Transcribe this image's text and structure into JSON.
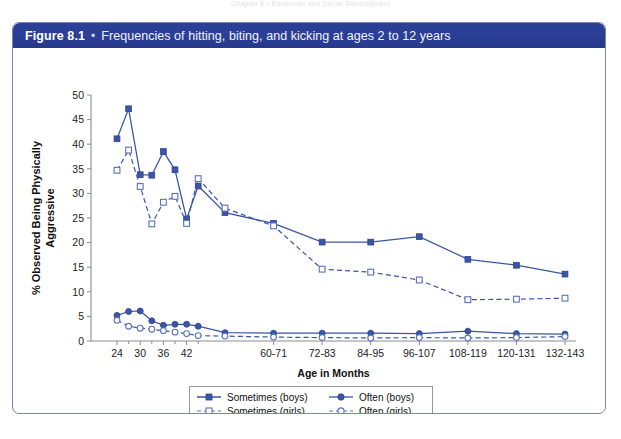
{
  "page": {
    "running_head": "Chapter 8    •    Emotional and Social Development"
  },
  "figure": {
    "number": "Figure 8.1",
    "bullet": "•",
    "title": "Frequencies of hitting, biting, and kicking at ages 2 to 12 years"
  },
  "legend": {
    "position": "bottom-center",
    "entries": [
      {
        "label": "Sometimes (boys)",
        "marker": "filled-square",
        "line": "solid",
        "color": "#3a55a5"
      },
      {
        "label": "Often (boys)",
        "marker": "filled-circle",
        "line": "solid",
        "color": "#3a55a5"
      },
      {
        "label": "Sometimes (girls)",
        "marker": "open-square",
        "line": "dashed",
        "color": "#5a72bd"
      },
      {
        "label": "Often (girls)",
        "marker": "open-circle",
        "line": "dashed",
        "color": "#5a72bd"
      }
    ]
  },
  "chart_data": {
    "type": "line",
    "title": "Frequencies of hitting, biting, and kicking at ages 2 to 12 years",
    "xlabel": "Age in Months",
    "ylabel": "% Observed Being Physically Aggressive",
    "ylim": [
      0,
      50
    ],
    "ytick_labels": [
      "0",
      "5",
      "10",
      "15",
      "20",
      "25",
      "30",
      "35",
      "40",
      "45",
      "50"
    ],
    "yticks": [
      0,
      5,
      10,
      15,
      20,
      25,
      30,
      35,
      40,
      45,
      50
    ],
    "grid": false,
    "x_tick_labels": [
      "24",
      "30",
      "36",
      "42",
      "60-71",
      "72-83",
      "84-95",
      "96-107",
      "108-119",
      "120-131",
      "132-143"
    ],
    "x_categories": [
      "24",
      "27",
      "30",
      "33",
      "36",
      "39",
      "42",
      "45",
      "48-59",
      "60-71",
      "72-83",
      "84-95",
      "96-107",
      "108-119",
      "120-131",
      "132-143"
    ],
    "series": [
      {
        "name": "Sometimes (boys)",
        "marker": "filled-square",
        "line": "solid",
        "color": "#3a55a5",
        "values": [
          41.1,
          47.2,
          33.8,
          33.7,
          38.5,
          34.8,
          24.8,
          31.5,
          26.1,
          23.9,
          20.1,
          20.1,
          21.2,
          16.6,
          15.4,
          13.6
        ]
      },
      {
        "name": "Sometimes (girls)",
        "marker": "open-square",
        "line": "dashed",
        "color": "#5a72bd",
        "values": [
          34.7,
          38.8,
          31.4,
          23.8,
          28.2,
          29.4,
          23.9,
          33.0,
          27.0,
          23.4,
          14.6,
          14.0,
          12.4,
          8.4,
          8.5,
          8.7
        ]
      },
      {
        "name": "Often (boys)",
        "marker": "filled-circle",
        "line": "solid",
        "color": "#3a55a5",
        "values": [
          5.2,
          6.0,
          6.1,
          4.1,
          3.2,
          3.4,
          3.4,
          3.0,
          1.7,
          1.6,
          1.6,
          1.6,
          1.5,
          2.0,
          1.5,
          1.4
        ]
      },
      {
        "name": "Often (girls)",
        "marker": "open-circle",
        "line": "dashed",
        "color": "#5a72bd",
        "values": [
          4.2,
          3.0,
          2.6,
          2.4,
          2.1,
          1.8,
          1.5,
          1.1,
          1.0,
          0.8,
          0.7,
          0.6,
          0.7,
          0.6,
          0.7,
          0.9
        ]
      }
    ]
  }
}
